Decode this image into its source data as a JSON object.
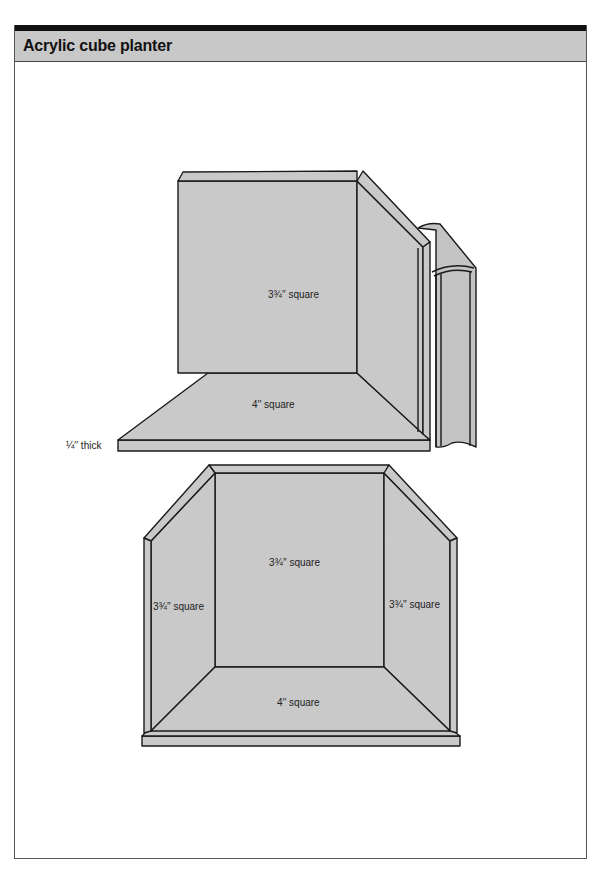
{
  "header": {
    "title": "Acrylic cube planter"
  },
  "colors": {
    "panel": "#c9c9c9",
    "panel_dark": "#bdbdbd",
    "stroke": "#1a1a1a",
    "header_bg": "#c8c8c8",
    "top_bar": "#111111"
  },
  "top_drawing": {
    "back_panel_label": "3¾′′ square",
    "base_label": "4′′ square",
    "thickness_label": "¼′′ thick"
  },
  "bottom_drawing": {
    "back_panel_label": "3¾′′ square",
    "left_panel_label": "3¾′′ square",
    "right_panel_label": "3¾′′ square",
    "base_label": "4′′ square"
  }
}
